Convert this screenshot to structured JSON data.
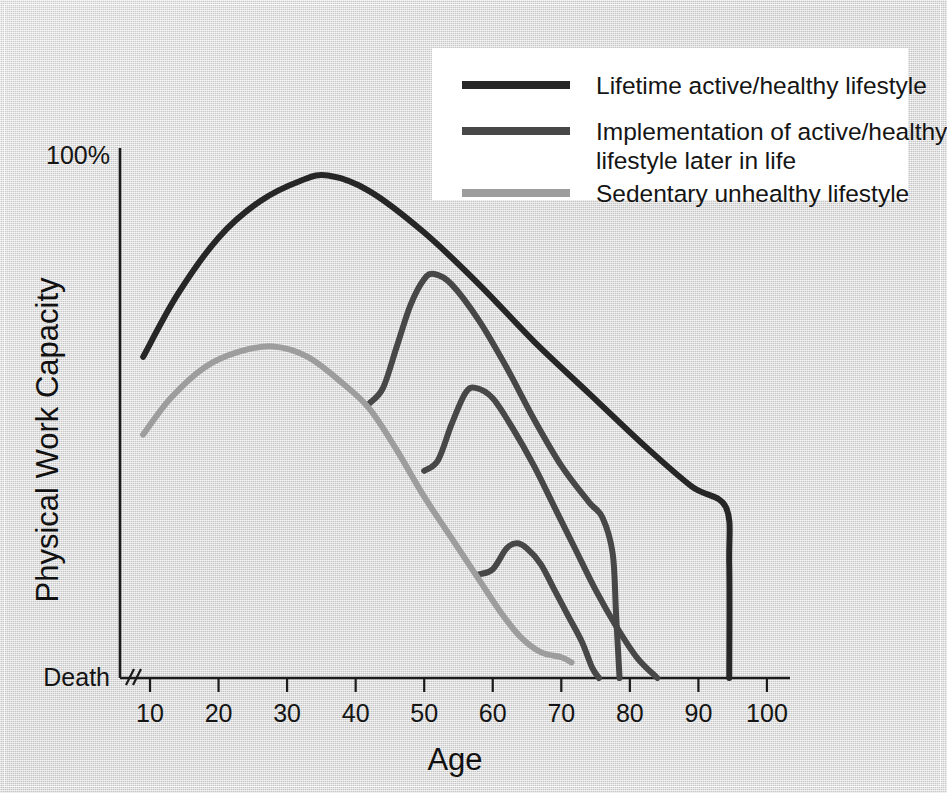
{
  "figure": {
    "background_color": "#d3d3d3",
    "plot_background": "#d3d3d3"
  },
  "chart_data": {
    "type": "line",
    "title": "",
    "subtitle": "",
    "xlabel": "Age",
    "ylabel": "Physical Work Capacity",
    "xlim": [
      5,
      102
    ],
    "ylim": [
      0,
      100
    ],
    "xticks": [
      10,
      20,
      30,
      40,
      50,
      60,
      70,
      80,
      90,
      100
    ],
    "xtick_labels": [
      "10",
      "20",
      "30",
      "40",
      "50",
      "60",
      "70",
      "80",
      "90",
      "100"
    ],
    "ytick_labels_special": {
      "top": "100%",
      "bottom": "Death"
    },
    "y_axis_break": true,
    "grid": false,
    "legend_position": "top-right",
    "series": [
      {
        "name": "Lifetime active/healthy lifestyle",
        "color": "#262626",
        "linewidth": 6,
        "points": [
          [
            9,
            62
          ],
          [
            14,
            74
          ],
          [
            20,
            85
          ],
          [
            26,
            92
          ],
          [
            32,
            96
          ],
          [
            36,
            97
          ],
          [
            42,
            94
          ],
          [
            50,
            86
          ],
          [
            58,
            76
          ],
          [
            66,
            65
          ],
          [
            74,
            55
          ],
          [
            82,
            45
          ],
          [
            89,
            37
          ],
          [
            94,
            33
          ],
          [
            94.5,
            22
          ],
          [
            94.5,
            0
          ]
        ]
      },
      {
        "name": "Implementation of active/healthy lifestyle later in life",
        "color": "#474747",
        "linewidth": 6,
        "branch_age": 42,
        "peak_age": 51,
        "points": [
          [
            42,
            53
          ],
          [
            44,
            56
          ],
          [
            46,
            64
          ],
          [
            48,
            72
          ],
          [
            50,
            77
          ],
          [
            51.5,
            78
          ],
          [
            54,
            76
          ],
          [
            58,
            69
          ],
          [
            62,
            60
          ],
          [
            66,
            50
          ],
          [
            70,
            41
          ],
          [
            74,
            34
          ],
          [
            76,
            31
          ],
          [
            77.5,
            24
          ],
          [
            78,
            12
          ],
          [
            78.5,
            0
          ]
        ]
      },
      {
        "name": "Implementation of active/healthy lifestyle later in life",
        "color": "#474747",
        "linewidth": 6,
        "branch_age": 50,
        "peak_age": 56,
        "points": [
          [
            50,
            40
          ],
          [
            52,
            42
          ],
          [
            54,
            49
          ],
          [
            56,
            55
          ],
          [
            57.5,
            56
          ],
          [
            60,
            54
          ],
          [
            63,
            48
          ],
          [
            66,
            41
          ],
          [
            69,
            33
          ],
          [
            72,
            25
          ],
          [
            75,
            17
          ],
          [
            78,
            10
          ],
          [
            81,
            4
          ],
          [
            84,
            0
          ]
        ]
      },
      {
        "name": "Implementation of active/healthy lifestyle later in life",
        "color": "#474747",
        "linewidth": 6,
        "branch_age": 58,
        "peak_age": 62,
        "points": [
          [
            58,
            20
          ],
          [
            60,
            21
          ],
          [
            62,
            25
          ],
          [
            63.5,
            26
          ],
          [
            65,
            25
          ],
          [
            67,
            22
          ],
          [
            69,
            17
          ],
          [
            71,
            12
          ],
          [
            73,
            7
          ],
          [
            74.5,
            2
          ],
          [
            75.5,
            0
          ]
        ]
      },
      {
        "name": "Sedentary unhealthy lifestyle",
        "color": "#9d9d9d",
        "linewidth": 6,
        "points": [
          [
            9,
            47
          ],
          [
            13,
            54
          ],
          [
            18,
            60
          ],
          [
            23,
            63
          ],
          [
            28,
            64
          ],
          [
            33,
            62
          ],
          [
            38,
            57
          ],
          [
            42,
            52
          ],
          [
            46,
            44
          ],
          [
            50,
            35
          ],
          [
            54,
            27
          ],
          [
            58,
            19
          ],
          [
            61,
            13
          ],
          [
            64,
            8
          ],
          [
            67,
            5
          ],
          [
            70,
            4
          ],
          [
            71.5,
            3
          ]
        ]
      }
    ]
  },
  "legend": {
    "entries": [
      {
        "label_lines": [
          "Lifetime active/healthy lifestyle"
        ],
        "color": "#262626"
      },
      {
        "label_lines": [
          "Implementation of active/healthy",
          "lifestyle later in life"
        ],
        "color": "#474747"
      },
      {
        "label_lines": [
          "Sedentary unhealthy lifestyle"
        ],
        "color": "#9d9d9d"
      }
    ]
  },
  "axes": {
    "y_top_label": "100%",
    "y_bottom_label": "Death",
    "y_axis_title": "Physical Work Capacity",
    "x_axis_title": "Age",
    "x_tick_labels": [
      "10",
      "20",
      "30",
      "40",
      "50",
      "60",
      "70",
      "80",
      "90",
      "100"
    ]
  }
}
